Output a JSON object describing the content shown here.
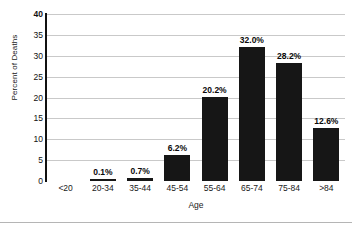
{
  "chart_data": {
    "type": "bar",
    "title": "",
    "xlabel": "Age",
    "ylabel": "Percent of Deaths",
    "categories": [
      "<20",
      "20-34",
      "35-44",
      "45-54",
      "55-64",
      "65-74",
      "75-84",
      ">84"
    ],
    "values": [
      0,
      0.1,
      0.7,
      6.2,
      20.2,
      32.0,
      28.2,
      12.6
    ],
    "data_labels": [
      "",
      "0.1%",
      "0.7%",
      "6.2%",
      "20.2%",
      "32.0%",
      "28.2%",
      "12.6%"
    ],
    "ylim": [
      0,
      40
    ],
    "ytick_labels": [
      "40",
      "35",
      "30",
      "25",
      "20",
      "15",
      "10",
      "5",
      "0"
    ],
    "ytick_values": [
      40,
      35,
      30,
      25,
      20,
      15,
      10,
      5,
      0
    ],
    "grid": true,
    "legend": "none",
    "bar_color": "#161616",
    "grid_color": "#c9c9c9",
    "axis_color": "#111111",
    "text_color": "#1a1a1a"
  }
}
